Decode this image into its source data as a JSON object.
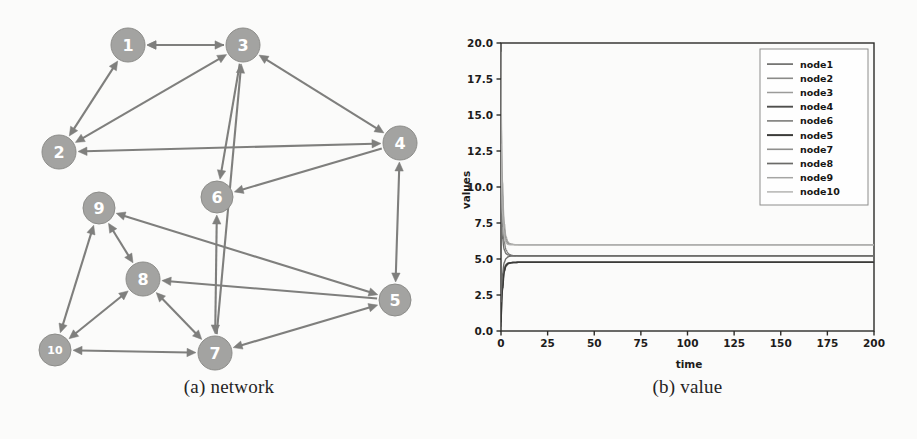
{
  "figure": {
    "panels": [
      {
        "id": "a",
        "caption": "(a) network"
      },
      {
        "id": "b",
        "caption": "(b) value"
      }
    ]
  },
  "network": {
    "caption": "(a) network",
    "node_color": "#a3a3a1",
    "node_stroke": "#8d8d8a",
    "edge_color": "#7f7f7d",
    "label_color": "#ffffff",
    "nodes": [
      {
        "id": "1",
        "label": "1",
        "x": 128,
        "y": 45,
        "r": 17
      },
      {
        "id": "2",
        "label": "2",
        "x": 59,
        "y": 152,
        "r": 17
      },
      {
        "id": "3",
        "label": "3",
        "x": 243,
        "y": 45,
        "r": 17
      },
      {
        "id": "4",
        "label": "4",
        "x": 400,
        "y": 143,
        "r": 17
      },
      {
        "id": "5",
        "label": "5",
        "x": 395,
        "y": 300,
        "r": 16
      },
      {
        "id": "6",
        "label": "6",
        "x": 217,
        "y": 197,
        "r": 16
      },
      {
        "id": "7",
        "label": "7",
        "x": 215,
        "y": 353,
        "r": 17
      },
      {
        "id": "8",
        "label": "8",
        "x": 143,
        "y": 279,
        "r": 17
      },
      {
        "id": "9",
        "label": "9",
        "x": 99,
        "y": 208,
        "r": 16
      },
      {
        "id": "10",
        "label": "10",
        "x": 55,
        "y": 350,
        "r": 16
      }
    ],
    "edges": [
      {
        "from": "1",
        "to": "3",
        "arrows": "both"
      },
      {
        "from": "1",
        "to": "2",
        "arrows": "both"
      },
      {
        "from": "2",
        "to": "3",
        "arrows": "both"
      },
      {
        "from": "2",
        "to": "4",
        "arrows": "both"
      },
      {
        "from": "3",
        "to": "4",
        "arrows": "both"
      },
      {
        "from": "3",
        "to": "6",
        "arrows": "forward"
      },
      {
        "from": "3",
        "to": "1",
        "arrows": "forward"
      },
      {
        "from": "4",
        "to": "6",
        "arrows": "forward"
      },
      {
        "from": "4",
        "to": "5",
        "arrows": "both"
      },
      {
        "from": "5",
        "to": "9",
        "arrows": "both"
      },
      {
        "from": "5",
        "to": "8",
        "arrows": "forward"
      },
      {
        "from": "5",
        "to": "7",
        "arrows": "both"
      },
      {
        "from": "6",
        "to": "7",
        "arrows": "both"
      },
      {
        "from": "7",
        "to": "3",
        "arrows": "forward"
      },
      {
        "from": "7",
        "to": "8",
        "arrows": "both"
      },
      {
        "from": "7",
        "to": "10",
        "arrows": "both"
      },
      {
        "from": "8",
        "to": "9",
        "arrows": "both"
      },
      {
        "from": "8",
        "to": "10",
        "arrows": "both"
      },
      {
        "from": "9",
        "to": "10",
        "arrows": "both"
      }
    ]
  },
  "chart_data": {
    "type": "line",
    "title": "",
    "caption": "(b) value",
    "xlabel": "time",
    "ylabel": "values",
    "xlim": [
      0,
      200
    ],
    "ylim": [
      0,
      20
    ],
    "xticks": [
      0,
      25,
      50,
      75,
      100,
      125,
      150,
      175,
      200
    ],
    "xticklabels": [
      "0",
      "25",
      "50",
      "75",
      "100",
      "125",
      "150",
      "175",
      "200"
    ],
    "yticks": [
      0.0,
      2.5,
      5.0,
      7.5,
      10.0,
      12.5,
      15.0,
      17.5,
      20.0
    ],
    "yticklabels": [
      "0.0",
      "2.5",
      "5.0",
      "7.5",
      "10.0",
      "12.5",
      "15.0",
      "17.5",
      "20.0"
    ],
    "grid": false,
    "legend_position": "upper right",
    "legend_entries": [
      "node1",
      "node2",
      "node3",
      "node4",
      "node6",
      "node5",
      "node7",
      "node8",
      "node9",
      "node10"
    ],
    "x": [
      0,
      1,
      2,
      3,
      4,
      5,
      6,
      8,
      10,
      15,
      25,
      50,
      100,
      150,
      200
    ],
    "series": [
      {
        "name": "node1",
        "color": "#6e6e6c",
        "width": 1.3,
        "values": [
          8.6,
          6.4,
          5.6,
          5.35,
          5.28,
          5.25,
          5.24,
          5.23,
          5.22,
          5.22,
          5.22,
          5.22,
          5.22,
          5.22,
          5.22
        ]
      },
      {
        "name": "node2",
        "color": "#8a8a88",
        "width": 1.2,
        "values": [
          1.1,
          3.6,
          4.4,
          4.65,
          4.72,
          4.75,
          4.76,
          4.77,
          4.78,
          4.78,
          4.78,
          4.78,
          4.78,
          4.78,
          4.78
        ]
      },
      {
        "name": "node3",
        "color": "#9b9b99",
        "width": 1.1,
        "values": [
          14.0,
          8.2,
          6.6,
          6.2,
          6.06,
          6.02,
          6.01,
          6.0,
          6.0,
          6.0,
          6.0,
          6.0,
          6.0,
          6.0,
          6.0
        ]
      },
      {
        "name": "node4",
        "color": "#4e4e4c",
        "width": 1.5,
        "values": [
          0.3,
          3.2,
          4.3,
          4.6,
          4.7,
          4.73,
          4.75,
          4.76,
          4.77,
          4.77,
          4.77,
          4.77,
          4.77,
          4.77,
          4.77
        ]
      },
      {
        "name": "node6",
        "color": "#7b7b79",
        "width": 1.2,
        "values": [
          11.0,
          7.2,
          6.1,
          5.6,
          5.4,
          5.3,
          5.26,
          5.23,
          5.22,
          5.22,
          5.22,
          5.22,
          5.22,
          5.22,
          5.22
        ]
      },
      {
        "name": "node5",
        "color": "#3b3b39",
        "width": 1.6,
        "values": [
          0.6,
          3.0,
          4.2,
          4.55,
          4.68,
          4.72,
          4.74,
          4.76,
          4.77,
          4.77,
          4.77,
          4.77,
          4.77,
          4.77,
          4.77
        ]
      },
      {
        "name": "node7",
        "color": "#8f8f8d",
        "width": 1.2,
        "values": [
          17.5,
          9.3,
          7.0,
          6.35,
          6.12,
          6.04,
          6.02,
          6.0,
          6.0,
          6.0,
          6.0,
          6.0,
          6.0,
          6.0,
          6.0
        ]
      },
      {
        "name": "node8",
        "color": "#6a6a68",
        "width": 1.3,
        "values": [
          2.0,
          4.0,
          4.8,
          5.05,
          5.15,
          5.19,
          5.2,
          5.21,
          5.22,
          5.22,
          5.22,
          5.22,
          5.22,
          5.22,
          5.22
        ]
      },
      {
        "name": "node9",
        "color": "#a5a5a3",
        "width": 1.1,
        "values": [
          19.4,
          10.2,
          7.4,
          6.5,
          6.18,
          6.07,
          6.03,
          6.01,
          6.0,
          6.0,
          6.0,
          6.0,
          6.0,
          6.0,
          6.0
        ]
      },
      {
        "name": "node10",
        "color": "#b4b4b2",
        "width": 1.1,
        "values": [
          13.0,
          8.0,
          6.5,
          6.1,
          6.0,
          5.98,
          5.98,
          5.98,
          5.98,
          5.98,
          5.98,
          5.98,
          5.98,
          5.98,
          5.98
        ]
      }
    ],
    "converged_levels": [
      6.0,
      5.22,
      4.77
    ]
  }
}
